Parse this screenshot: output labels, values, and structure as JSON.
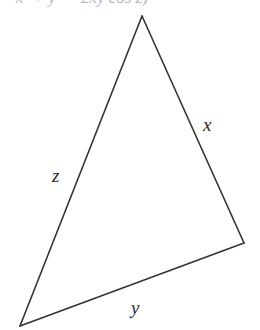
{
  "header_fragment": "= x² + y² − 2xy cos z)",
  "figure": {
    "type": "triangle",
    "stroke_color": "#333333",
    "vertices": {
      "apex": [
        142,
        16
      ],
      "right": [
        244,
        243
      ],
      "bottom_left": [
        20,
        326
      ]
    },
    "labels": {
      "x": "x",
      "y": "y",
      "z": "z"
    }
  }
}
